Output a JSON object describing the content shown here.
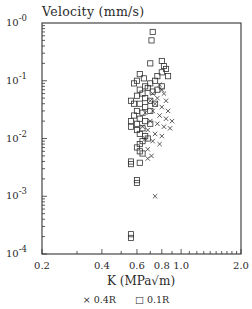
{
  "chart_data": {
    "type": "scatter",
    "title": "",
    "ylabel": "Velocity (mm/s)",
    "xlabel": "K (MPa√m)",
    "xscale": "log",
    "yscale": "log",
    "xlim": [
      0.2,
      2.0
    ],
    "ylim": [
      0.0001,
      1.0
    ],
    "x_ticks": [
      "0.2",
      "0.4",
      "0.6",
      "0.8",
      "1.0",
      "2.0"
    ],
    "x_tick_values": [
      0.2,
      0.4,
      0.6,
      0.8,
      1.0,
      2.0
    ],
    "y_ticks": [
      {
        "base": "10",
        "exp": "-0",
        "value": 1.0
      },
      {
        "base": "10",
        "exp": "-1",
        "value": 0.1
      },
      {
        "base": "10",
        "exp": "-2",
        "value": 0.01
      },
      {
        "base": "10",
        "exp": "-3",
        "value": 0.001
      },
      {
        "base": "10",
        "exp": "-4",
        "value": 0.0001
      }
    ],
    "grid": false,
    "legend_position": "bottom",
    "series": [
      {
        "name": "0.4R",
        "marker": "x",
        "points": [
          [
            0.78,
            0.085
          ],
          [
            0.8,
            0.07
          ],
          [
            0.82,
            0.06
          ],
          [
            0.76,
            0.05
          ],
          [
            0.84,
            0.045
          ],
          [
            0.74,
            0.04
          ],
          [
            0.8,
            0.035
          ],
          [
            0.86,
            0.03
          ],
          [
            0.72,
            0.03
          ],
          [
            0.78,
            0.025
          ],
          [
            0.84,
            0.022
          ],
          [
            0.7,
            0.02
          ],
          [
            0.76,
            0.018
          ],
          [
            0.82,
            0.016
          ],
          [
            0.88,
            0.015
          ],
          [
            0.68,
            0.014
          ],
          [
            0.74,
            0.012
          ],
          [
            0.8,
            0.011
          ],
          [
            0.66,
            0.01
          ],
          [
            0.72,
            0.009
          ],
          [
            0.78,
            0.008
          ],
          [
            0.68,
            0.0065
          ],
          [
            0.71,
            0.005
          ],
          [
            0.68,
            0.0045
          ],
          [
            0.74,
            0.001
          ],
          [
            0.72,
            0.06
          ],
          [
            0.7,
            0.045
          ],
          [
            0.66,
            0.028
          ],
          [
            0.9,
            0.02
          ],
          [
            0.64,
            0.016
          ]
        ]
      },
      {
        "name": "0.1R",
        "marker": "square",
        "points": [
          [
            0.72,
            0.7
          ],
          [
            0.71,
            0.5
          ],
          [
            0.7,
            0.2
          ],
          [
            0.8,
            0.22
          ],
          [
            0.82,
            0.18
          ],
          [
            0.84,
            0.16
          ],
          [
            0.8,
            0.14
          ],
          [
            0.86,
            0.12
          ],
          [
            0.76,
            0.12
          ],
          [
            0.62,
            0.13
          ],
          [
            0.65,
            0.11
          ],
          [
            0.58,
            0.09
          ],
          [
            0.6,
            0.1
          ],
          [
            0.66,
            0.08
          ],
          [
            0.7,
            0.09
          ],
          [
            0.74,
            0.1
          ],
          [
            0.68,
            0.075
          ],
          [
            0.62,
            0.07
          ],
          [
            0.64,
            0.06
          ],
          [
            0.72,
            0.065
          ],
          [
            0.76,
            0.07
          ],
          [
            0.8,
            0.08
          ],
          [
            0.6,
            0.055
          ],
          [
            0.66,
            0.05
          ],
          [
            0.7,
            0.045
          ],
          [
            0.56,
            0.045
          ],
          [
            0.58,
            0.04
          ],
          [
            0.62,
            0.04
          ],
          [
            0.66,
            0.035
          ],
          [
            0.74,
            0.04
          ],
          [
            0.6,
            0.03
          ],
          [
            0.64,
            0.028
          ],
          [
            0.7,
            0.03
          ],
          [
            0.58,
            0.025
          ],
          [
            0.62,
            0.022
          ],
          [
            0.56,
            0.02
          ],
          [
            0.6,
            0.018
          ],
          [
            0.66,
            0.02
          ],
          [
            0.7,
            0.018
          ],
          [
            0.64,
            0.015
          ],
          [
            0.56,
            0.016
          ],
          [
            0.6,
            0.014
          ],
          [
            0.62,
            0.012
          ],
          [
            0.66,
            0.011
          ],
          [
            0.68,
            0.01
          ],
          [
            0.64,
            0.009
          ],
          [
            0.62,
            0.008
          ],
          [
            0.6,
            0.007
          ],
          [
            0.62,
            0.006
          ],
          [
            0.64,
            0.0055
          ],
          [
            0.56,
            0.004
          ],
          [
            0.56,
            0.0036
          ],
          [
            0.62,
            0.0038
          ],
          [
            0.6,
            0.0019
          ],
          [
            0.6,
            0.0017
          ],
          [
            0.56,
            0.00022
          ],
          [
            0.56,
            0.00019
          ]
        ]
      }
    ]
  },
  "labels": {
    "ylabel": "Velocity (mm/s)",
    "xlabel": "K (MPa√m)",
    "legend_x": "× 0.4R",
    "legend_sq": "□ 0.1R"
  }
}
